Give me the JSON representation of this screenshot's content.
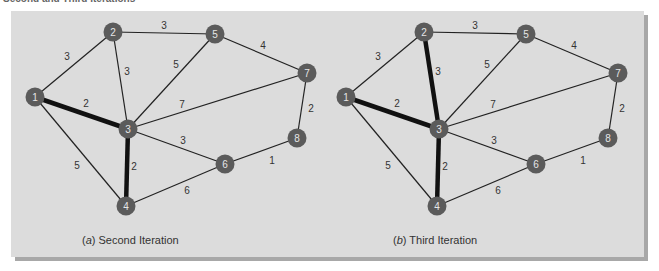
{
  "figure_title": "Second and Third Iterations",
  "colors": {
    "panel": "#dcdcdc",
    "panel_shadow": "#a8a8a8",
    "node_fill": "#5b5b5b",
    "node_text": "#e6e6e6",
    "edge": "#222222"
  },
  "nodes": [
    {
      "id": "1",
      "x": 35,
      "y": 97
    },
    {
      "id": "2",
      "x": 113,
      "y": 32
    },
    {
      "id": "3",
      "x": 128,
      "y": 129
    },
    {
      "id": "4",
      "x": 126,
      "y": 206
    },
    {
      "id": "5",
      "x": 215,
      "y": 34
    },
    {
      "id": "6",
      "x": 225,
      "y": 164
    },
    {
      "id": "7",
      "x": 307,
      "y": 73
    },
    {
      "id": "8",
      "x": 297,
      "y": 138
    }
  ],
  "edges": [
    {
      "from": "1",
      "to": "2",
      "weight": "3",
      "lx": 67,
      "ly": 56
    },
    {
      "from": "1",
      "to": "3",
      "weight": "2",
      "lx": 86,
      "ly": 103
    },
    {
      "from": "1",
      "to": "4",
      "weight": "5",
      "lx": 77,
      "ly": 165
    },
    {
      "from": "2",
      "to": "5",
      "weight": "3",
      "lx": 164,
      "ly": 25
    },
    {
      "from": "2",
      "to": "3",
      "weight": "3",
      "lx": 127,
      "ly": 71
    },
    {
      "from": "3",
      "to": "5",
      "weight": "5",
      "lx": 176,
      "ly": 64
    },
    {
      "from": "3",
      "to": "7",
      "weight": "7",
      "lx": 182,
      "ly": 104
    },
    {
      "from": "3",
      "to": "6",
      "weight": "3",
      "lx": 183,
      "ly": 140
    },
    {
      "from": "3",
      "to": "4",
      "weight": "2",
      "lx": 134,
      "ly": 166
    },
    {
      "from": "4",
      "to": "6",
      "weight": "6",
      "lx": 187,
      "ly": 190
    },
    {
      "from": "5",
      "to": "7",
      "weight": "4",
      "lx": 263,
      "ly": 45
    },
    {
      "from": "7",
      "to": "8",
      "weight": "2",
      "lx": 311,
      "ly": 108
    },
    {
      "from": "6",
      "to": "8",
      "weight": "1",
      "lx": 272,
      "ly": 160
    }
  ],
  "panels": [
    {
      "id": "a",
      "offset_x": 0,
      "caption_letter": "a",
      "caption_text": "Second Iteration",
      "caption_x": 82,
      "bold_edges": [
        "1-3",
        "3-4"
      ]
    },
    {
      "id": "b",
      "offset_x": 311,
      "caption_letter": "b",
      "caption_text": "Third Iteration",
      "caption_x": 393,
      "bold_edges": [
        "1-3",
        "3-4",
        "2-3"
      ]
    }
  ]
}
